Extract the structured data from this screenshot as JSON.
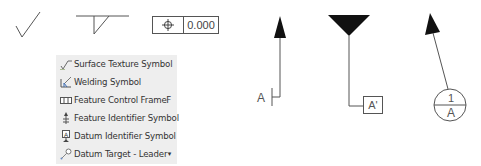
{
  "symbols": {
    "surface_texture": {
      "icon": "surface-texture-check-icon"
    },
    "weld_flag": {
      "icon": "weld-symbol-icon"
    },
    "feature_control_frame": {
      "icon": "position-tolerance-icon",
      "value": "0.000"
    },
    "feature_identifier": {
      "label": "A",
      "icon": "leader-arrow-icon"
    },
    "datum_identifier": {
      "label": "A'",
      "icon": "datum-triangle-icon"
    },
    "datum_target": {
      "top": "1",
      "bottom": "A",
      "icon": "datum-target-balloon-icon"
    }
  },
  "menu": {
    "items": [
      {
        "label": "Surface Texture Symbol",
        "icon": "surface-texture-icon",
        "shortcut": ""
      },
      {
        "label": "Welding Symbol",
        "icon": "welding-icon",
        "shortcut": ""
      },
      {
        "label": "Feature Control Frame",
        "icon": "feature-control-frame-icon",
        "shortcut": "F"
      },
      {
        "label": "Feature Identifier Symbol",
        "icon": "feature-identifier-icon",
        "shortcut": ""
      },
      {
        "label": "Datum Identifier Symbol",
        "icon": "datum-identifier-icon",
        "shortcut": ""
      },
      {
        "label": "Datum Target - Leader",
        "icon": "datum-target-leader-icon",
        "shortcut": "▾"
      }
    ]
  },
  "colors": {
    "menu_bg": "#eeeeee",
    "line": "#555555",
    "fill": "#111111"
  }
}
